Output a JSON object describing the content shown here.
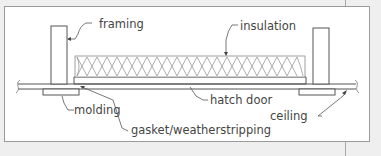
{
  "diagram": {
    "labels": {
      "framing": "framing",
      "insulation": "insulation",
      "molding": "molding",
      "gasket": "gasket/weatherstripping",
      "hatch_door": "hatch door",
      "ceiling": "ceiling"
    },
    "colors": {
      "background": "#efefef",
      "panel": "#ffffff",
      "line": "#555555",
      "insulation_stroke": "#888888",
      "text": "#444444"
    }
  }
}
